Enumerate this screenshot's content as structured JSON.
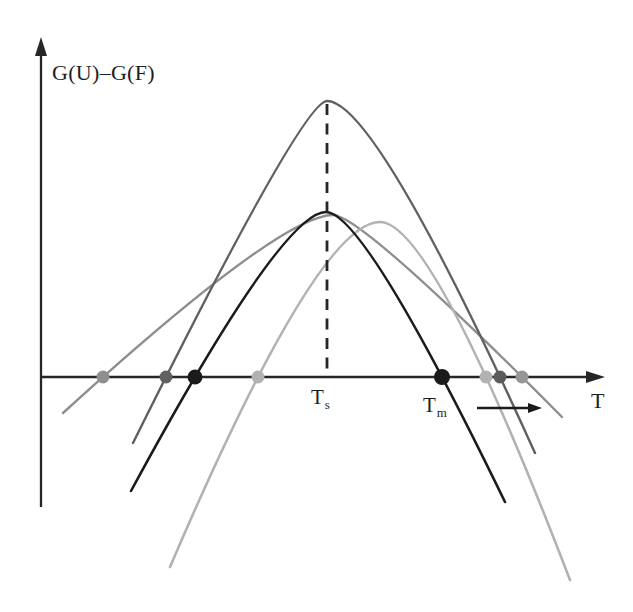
{
  "chart_data": {
    "type": "line",
    "title": "",
    "labels": {
      "ylabel": "G(U)–G(F)",
      "xlabel": "T",
      "ts": {
        "base": "T",
        "sub": "s"
      },
      "tm": {
        "base": "T",
        "sub": "m"
      }
    },
    "axes": {
      "origin": [
        41,
        377
      ],
      "axis_y": 377,
      "y_top": 37,
      "y_bottom": 507,
      "x_right": 605,
      "color": "#262626",
      "stroke_width": 2.3
    },
    "dashed_guide": {
      "x": 327,
      "y_top": 104,
      "y_bottom": 376,
      "dash": "11,8.5",
      "color": "#262626",
      "stroke_width": 2.8,
      "at_label": "Ts"
    },
    "series": [
      {
        "id": "wide-gray",
        "name": "broad shallow stability curve",
        "color": "#8e8e8e",
        "stroke_width": 2.4,
        "zeros": [
          103,
          522
        ],
        "peak": [
          333,
          215
        ],
        "left_end": [
          63,
          413
        ],
        "right_end": [
          562,
          417
        ]
      },
      {
        "id": "light-gray",
        "name": "right-shifted stability curve",
        "color": "#b2b2b2",
        "stroke_width": 2.6,
        "zeros": [
          258,
          486
        ],
        "peak": [
          380,
          222
        ],
        "left_end": [
          170,
          567
        ],
        "right_end": [
          570,
          580
        ]
      },
      {
        "id": "tall-gray",
        "name": "tall stability curve",
        "color": "#606060",
        "stroke_width": 2.4,
        "zeros": [
          166,
          500
        ],
        "peak": [
          327,
          101
        ],
        "left_end": [
          133,
          443
        ],
        "right_end": [
          535,
          453
        ]
      },
      {
        "id": "black",
        "name": "reference stability curve",
        "color": "#1b1b1b",
        "stroke_width": 2.6,
        "zeros": [
          195,
          442
        ],
        "peak": [
          326,
          212
        ],
        "left_end": [
          131,
          491
        ],
        "right_end": [
          505,
          502
        ]
      }
    ],
    "points": [
      {
        "x": 103,
        "y": 377,
        "r": 6.5,
        "color": "#8f8f8f",
        "series": "wide-gray"
      },
      {
        "x": 166,
        "y": 377,
        "r": 6.5,
        "color": "#616161",
        "series": "tall-gray"
      },
      {
        "x": 195,
        "y": 377,
        "r": 7.5,
        "color": "#1b1b1b",
        "series": "black"
      },
      {
        "x": 258,
        "y": 377,
        "r": 6.5,
        "color": "#b2b2b2",
        "series": "light-gray"
      },
      {
        "x": 442,
        "y": 377,
        "r": 8,
        "color": "#1b1b1b",
        "series": "black",
        "label": "Tm"
      },
      {
        "x": 486,
        "y": 377,
        "r": 6.5,
        "color": "#b2b2b2",
        "series": "light-gray"
      },
      {
        "x": 500,
        "y": 377,
        "r": 6.5,
        "color": "#5c5c5c",
        "series": "tall-gray"
      },
      {
        "x": 522,
        "y": 377,
        "r": 6.5,
        "color": "#969696",
        "series": "wide-gray"
      }
    ],
    "shift_arrow": {
      "x1": 477,
      "x2": 529,
      "tip_x": 542,
      "y": 408,
      "color": "#1b1b1b",
      "stroke_width": 2.3
    }
  }
}
